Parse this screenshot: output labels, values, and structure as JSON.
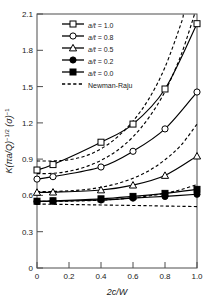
{
  "chart_data": {
    "type": "line",
    "title": "",
    "xlabel": "2c/W",
    "ylabel": "K(πa/Q)⁻¹ᐟ² (σ)⁻¹",
    "xlim": [
      0,
      1.0
    ],
    "ylim": [
      0,
      2.1
    ],
    "xticks": [
      "0",
      "0.2",
      "0.4",
      "0.6",
      "0.8",
      "1.0"
    ],
    "xtick_values": [
      0,
      0.2,
      0.4,
      0.6,
      0.8,
      1.0
    ],
    "yticks": [
      "0",
      "0.3",
      "0.6",
      "0.9",
      "1.2",
      "1.5",
      "1.8",
      "2.1"
    ],
    "ytick_values": [
      0,
      0.3,
      0.6,
      0.9,
      1.2,
      1.5,
      1.8,
      2.1
    ],
    "grid": false,
    "legend_position": "upper-left",
    "x": [
      0,
      0.1,
      0.4,
      0.6,
      0.8,
      1.0
    ],
    "series": [
      {
        "name": "a/t = 1.0",
        "label_prefix": "a/t",
        "label_value": "1.0",
        "marker": "open-square",
        "linestyle": "solid",
        "values": [
          0.81,
          0.855,
          1.04,
          1.19,
          1.48,
          2.02
        ]
      },
      {
        "name": "a/t = 0.8",
        "label_prefix": "a/t",
        "label_value": "0.8",
        "marker": "open-circle",
        "linestyle": "solid",
        "values": [
          0.735,
          0.755,
          0.835,
          0.965,
          1.15,
          1.455
        ]
      },
      {
        "name": "a/t = 0.5",
        "label_prefix": "a/t",
        "label_value": "0.5",
        "marker": "open-triangle",
        "linestyle": "solid",
        "values": [
          0.625,
          0.627,
          0.645,
          0.685,
          0.765,
          0.925
        ]
      },
      {
        "name": "a/t = 0.2",
        "label_prefix": "a/t",
        "label_value": "0.2",
        "marker": "filled-circle",
        "linestyle": "solid",
        "values": [
          0.55,
          0.552,
          0.562,
          0.578,
          0.592,
          0.61
        ]
      },
      {
        "name": "a/t = 0.0",
        "label_prefix": "a/t",
        "label_value": "0.0",
        "marker": "filled-square",
        "linestyle": "solid",
        "values": [
          0.552,
          0.556,
          0.572,
          0.592,
          0.617,
          0.65
        ]
      }
    ],
    "reference_series": {
      "name": "Newman-Raju",
      "linestyle": "dashed",
      "marker": "none",
      "x": [
        0,
        0.1,
        0.2,
        0.3,
        0.4,
        0.5,
        0.6,
        0.7,
        0.8,
        0.9,
        1.0
      ],
      "curves": [
        {
          "for": "a/t = 1.0",
          "values": [
            0.885,
            0.885,
            0.895,
            0.925,
            0.985,
            1.08,
            1.215,
            1.4,
            1.66,
            2.02,
            2.55
          ]
        },
        {
          "for": "a/t = 0.8",
          "values": [
            0.78,
            0.783,
            0.8,
            0.835,
            0.89,
            0.97,
            1.085,
            1.245,
            1.46,
            1.76,
            2.16
          ]
        },
        {
          "for": "a/t = 0.5",
          "values": [
            0.632,
            0.633,
            0.638,
            0.648,
            0.667,
            0.697,
            0.742,
            0.805,
            0.895,
            1.015,
            1.19
          ]
        },
        {
          "for": "a/t = 0.2",
          "values": [
            0.552,
            0.552,
            0.553,
            0.556,
            0.561,
            0.569,
            0.58,
            0.596,
            0.618,
            0.648,
            0.69
          ]
        },
        {
          "for": "a/t = 0.0",
          "values": [
            0.528,
            0.527,
            0.525,
            0.523,
            0.521,
            0.519,
            0.517,
            0.515,
            0.512,
            0.51,
            0.508
          ]
        }
      ]
    },
    "legend_entries": [
      {
        "marker": "open-square",
        "linestyle": "solid",
        "text": "a/t = 1.0"
      },
      {
        "marker": "open-circle",
        "linestyle": "solid",
        "text": "a/t = 0.8"
      },
      {
        "marker": "open-triangle",
        "linestyle": "solid",
        "text": "a/t = 0.5"
      },
      {
        "marker": "filled-circle",
        "linestyle": "solid",
        "text": "a/t = 0.2"
      },
      {
        "marker": "filled-square",
        "linestyle": "solid",
        "text": "a/t = 0.0"
      },
      {
        "marker": "none",
        "linestyle": "dashed",
        "text": "Newman-Raju"
      }
    ]
  },
  "legend": {
    "rows": [
      {
        "prefix": "a/t",
        "eq": " = ",
        "value": "1.0"
      },
      {
        "prefix": "a/t",
        "eq": " = ",
        "value": "0.8"
      },
      {
        "prefix": "a/t",
        "eq": " = ",
        "value": "0.5"
      },
      {
        "prefix": "a/t",
        "eq": " = ",
        "value": "0.2"
      },
      {
        "prefix": "a/t",
        "eq": " = ",
        "value": "0.0"
      },
      {
        "prefix": "",
        "eq": "",
        "value": "Newman-Raju"
      }
    ]
  },
  "axes": {
    "x_title": "2c/W",
    "y_title_main": "K",
    "y_title_paren1": "(πa/Q)",
    "y_title_exp1": "−1/2",
    "y_title_paren2": "(σ)",
    "y_title_exp2": "−1"
  }
}
